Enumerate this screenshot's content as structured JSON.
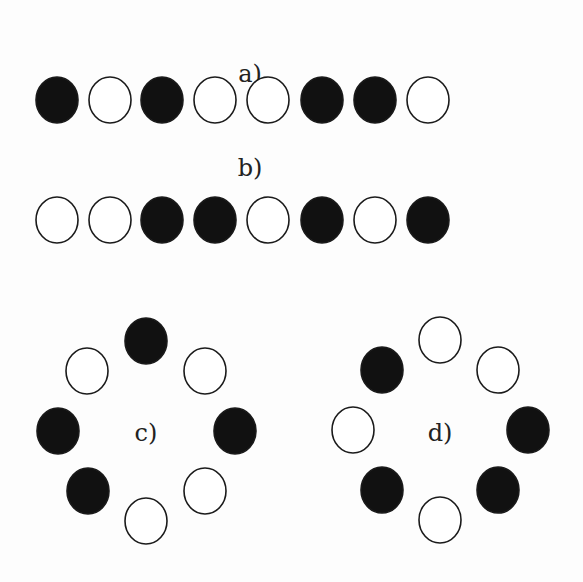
{
  "figure": {
    "panels": [
      {
        "id": "a",
        "label": "a)",
        "label_pos": [
          250,
          82
        ],
        "layout": "row",
        "beads": [
          {
            "x": 57,
            "y": 100,
            "filled": true
          },
          {
            "x": 110,
            "y": 100,
            "filled": false
          },
          {
            "x": 162,
            "y": 100,
            "filled": true
          },
          {
            "x": 215,
            "y": 100,
            "filled": false
          },
          {
            "x": 268,
            "y": 100,
            "filled": false
          },
          {
            "x": 322,
            "y": 100,
            "filled": true
          },
          {
            "x": 375,
            "y": 100,
            "filled": true
          },
          {
            "x": 428,
            "y": 100,
            "filled": false
          }
        ]
      },
      {
        "id": "b",
        "label": "b)",
        "label_pos": [
          250,
          176
        ],
        "layout": "row",
        "beads": [
          {
            "x": 57,
            "y": 220,
            "filled": false
          },
          {
            "x": 110,
            "y": 220,
            "filled": false
          },
          {
            "x": 162,
            "y": 220,
            "filled": true
          },
          {
            "x": 215,
            "y": 220,
            "filled": true
          },
          {
            "x": 268,
            "y": 220,
            "filled": false
          },
          {
            "x": 322,
            "y": 220,
            "filled": true
          },
          {
            "x": 375,
            "y": 220,
            "filled": false
          },
          {
            "x": 428,
            "y": 220,
            "filled": true
          }
        ]
      },
      {
        "id": "c",
        "label": "c)",
        "label_pos": [
          146,
          441
        ],
        "layout": "ring",
        "beads": [
          {
            "x": 146,
            "y": 341,
            "filled": true
          },
          {
            "x": 205,
            "y": 371,
            "filled": false
          },
          {
            "x": 235,
            "y": 431,
            "filled": true
          },
          {
            "x": 205,
            "y": 491,
            "filled": false
          },
          {
            "x": 146,
            "y": 521,
            "filled": false
          },
          {
            "x": 88,
            "y": 491,
            "filled": true
          },
          {
            "x": 58,
            "y": 431,
            "filled": true
          },
          {
            "x": 87,
            "y": 371,
            "filled": false
          }
        ]
      },
      {
        "id": "d",
        "label": "d)",
        "label_pos": [
          440,
          441
        ],
        "layout": "ring",
        "beads": [
          {
            "x": 440,
            "y": 340,
            "filled": false
          },
          {
            "x": 498,
            "y": 370,
            "filled": false
          },
          {
            "x": 528,
            "y": 430,
            "filled": true
          },
          {
            "x": 498,
            "y": 490,
            "filled": true
          },
          {
            "x": 440,
            "y": 520,
            "filled": false
          },
          {
            "x": 382,
            "y": 490,
            "filled": true
          },
          {
            "x": 353,
            "y": 430,
            "filled": false
          },
          {
            "x": 382,
            "y": 370,
            "filled": true
          }
        ]
      }
    ],
    "bead_rx": 21,
    "bead_ry": 23,
    "colors": {
      "filled": "#111111",
      "stroke": "#1a1a1a",
      "open": "#ffffff"
    }
  }
}
